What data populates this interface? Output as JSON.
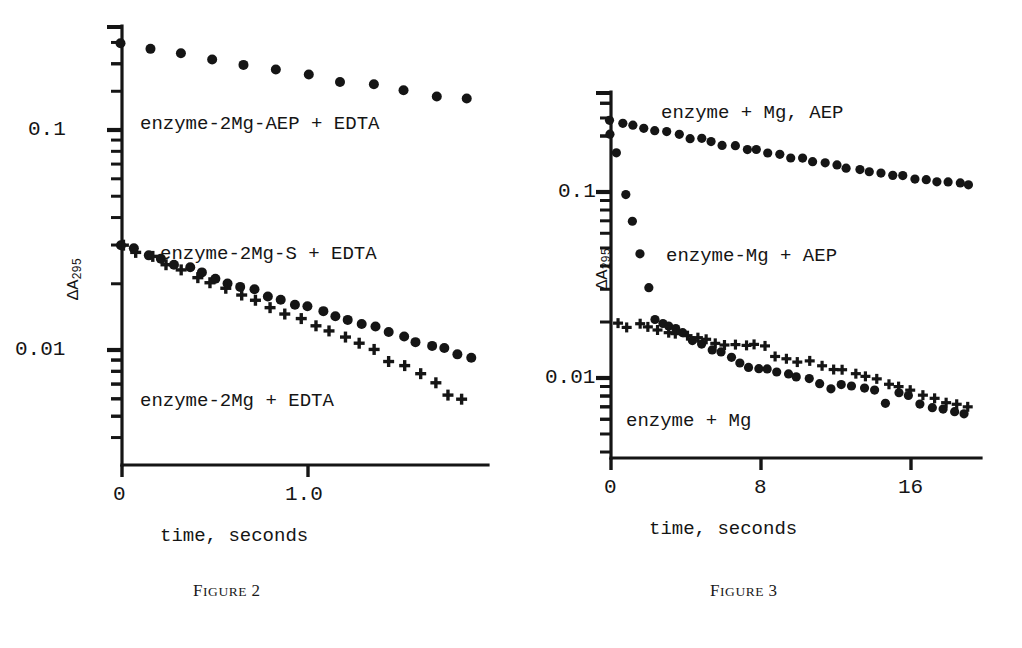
{
  "page": {
    "background": "#ffffff",
    "ink_color": "#151515",
    "width": 1022,
    "height": 648
  },
  "figures": [
    {
      "id": "figure-2",
      "caption_lead": "F",
      "caption_rest": "IGURE",
      "caption_number": "2",
      "caption_full": "FIGURE 2",
      "xlabel": "time, seconds",
      "ylabel_main": "ΔA",
      "ylabel_sub": "295",
      "x_tick_labels": [
        "0",
        "1.0"
      ],
      "x_tick_values": [
        0,
        1.0
      ],
      "y_tick_labels": [
        "0.1",
        "0.01"
      ],
      "y_tick_values": [
        0.1,
        0.01
      ],
      "series_labels": [
        "enzyme-2Mg-AEP + EDTA",
        "enzyme-2Mg-S + EDTA",
        "enzyme-2Mg + EDTA"
      ]
    },
    {
      "id": "figure-3",
      "caption_lead": "F",
      "caption_rest": "IGURE",
      "caption_number": "3",
      "caption_full": "FIGURE 3",
      "xlabel": "time, seconds",
      "ylabel_main": "ΔA",
      "ylabel_sub": "295",
      "x_tick_labels": [
        "0",
        "8",
        "16"
      ],
      "x_tick_values": [
        0,
        8,
        16
      ],
      "y_tick_labels": [
        "0.1",
        "0.01"
      ],
      "y_tick_values": [
        0.1,
        0.01
      ],
      "series_labels": [
        "enzyme + Mg, AEP",
        "enzyme-Mg + AEP",
        "enzyme + Mg"
      ]
    }
  ],
  "chart_data": [
    {
      "type": "scatter",
      "title": "FIGURE 2",
      "xlabel": "time, seconds",
      "ylabel": "ΔA295",
      "yscale": "log",
      "xlim": [
        0,
        1.98
      ],
      "ylim": [
        0.0042,
        0.26
      ],
      "grid": false,
      "legend": "inline-annotations",
      "x_ticks": [
        0,
        1.0
      ],
      "x_tick_labels": [
        "0",
        "1.0"
      ],
      "y_ticks": [
        0.01,
        0.1
      ],
      "y_tick_labels": [
        "0.01",
        "0.1"
      ],
      "y_minor_ticks": [
        0.005,
        0.006,
        0.007,
        0.008,
        0.009,
        0.02,
        0.03,
        0.04,
        0.05,
        0.06,
        0.07,
        0.08,
        0.09,
        0.2
      ],
      "series": [
        {
          "name": "enzyme-2Mg-AEP + EDTA",
          "marker": "circle",
          "x": [
            0.0,
            0.15,
            0.32,
            0.49,
            0.66,
            0.83,
            1.0,
            1.17,
            1.35,
            1.52,
            1.7,
            1.85
          ],
          "y": [
            0.244,
            0.232,
            0.221,
            0.209,
            0.198,
            0.186,
            0.177,
            0.168,
            0.159,
            0.151,
            0.144,
            0.138
          ]
        },
        {
          "name": "enzyme-2Mg-S + EDTA",
          "marker": "circle",
          "x": [
            0.0,
            0.07,
            0.14,
            0.21,
            0.28,
            0.36,
            0.43,
            0.5,
            0.57,
            0.64,
            0.72,
            0.79,
            0.86,
            0.93,
            1.0,
            1.08,
            1.15,
            1.22,
            1.29,
            1.37,
            1.44,
            1.51,
            1.58,
            1.66,
            1.73,
            1.8,
            1.88
          ],
          "y": [
            0.03,
            0.0286,
            0.0272,
            0.0258,
            0.0246,
            0.0234,
            0.0224,
            0.0214,
            0.0204,
            0.0195,
            0.0186,
            0.0178,
            0.017,
            0.0163,
            0.0156,
            0.0149,
            0.0143,
            0.0137,
            0.0131,
            0.0126,
            0.012,
            0.0115,
            0.011,
            0.0105,
            0.0101,
            0.0097,
            0.0093
          ]
        },
        {
          "name": "enzyme-2Mg + EDTA",
          "marker": "plus",
          "x": [
            0.0,
            0.08,
            0.16,
            0.24,
            0.32,
            0.4,
            0.48,
            0.56,
            0.64,
            0.72,
            0.8,
            0.88,
            0.96,
            1.04,
            1.12,
            1.2,
            1.28,
            1.36,
            1.44,
            1.52,
            1.6,
            1.68,
            1.76,
            1.82
          ],
          "y": [
            0.0298,
            0.0279,
            0.0262,
            0.0246,
            0.023,
            0.0216,
            0.0203,
            0.019,
            0.0178,
            0.0167,
            0.0157,
            0.0147,
            0.0138,
            0.0129,
            0.0121,
            0.0114,
            0.0107,
            0.01,
            0.009,
            0.0084,
            0.0079,
            0.0072,
            0.0062,
            0.006
          ]
        }
      ]
    },
    {
      "type": "scatter",
      "title": "FIGURE 3",
      "xlabel": "time, seconds",
      "ylabel": "ΔA295",
      "yscale": "log",
      "xlim": [
        0,
        19.5
      ],
      "ylim": [
        0.005,
        0.3
      ],
      "grid": false,
      "legend": "inline-annotations",
      "x_ticks": [
        0,
        8,
        16
      ],
      "x_tick_labels": [
        "0",
        "8",
        "16"
      ],
      "y_ticks": [
        0.01,
        0.1
      ],
      "y_tick_labels": [
        "0.01",
        "0.1"
      ],
      "y_minor_ticks": [
        0.006,
        0.007,
        0.008,
        0.009,
        0.02,
        0.03,
        0.04,
        0.05,
        0.06,
        0.07,
        0.08,
        0.09,
        0.2,
        0.3
      ],
      "series": [
        {
          "name": "enzyme + Mg, AEP",
          "marker": "circle",
          "x": [
            0.0,
            0.6,
            1.2,
            1.8,
            2.4,
            3.0,
            3.6,
            4.2,
            4.8,
            5.4,
            6.0,
            6.6,
            7.2,
            7.8,
            8.4,
            9.0,
            9.6,
            10.2,
            10.8,
            11.4,
            12.0,
            12.6,
            13.2,
            13.8,
            14.4,
            15.0,
            15.6,
            16.2,
            16.8,
            17.4,
            18.0,
            18.6,
            19.0
          ],
          "y": [
            0.238,
            0.232,
            0.226,
            0.22,
            0.214,
            0.208,
            0.202,
            0.197,
            0.191,
            0.186,
            0.181,
            0.176,
            0.171,
            0.167,
            0.162,
            0.158,
            0.154,
            0.15,
            0.146,
            0.143,
            0.139,
            0.136,
            0.133,
            0.13,
            0.127,
            0.124,
            0.122,
            0.119,
            0.117,
            0.115,
            0.113,
            0.111,
            0.11
          ]
        },
        {
          "name": "enzyme-Mg + AEP",
          "marker": "circle",
          "x": [
            0.0,
            0.35,
            0.75,
            1.15,
            1.55,
            1.95,
            2.35,
            2.75,
            3.1,
            3.5,
            3.9,
            4.4,
            4.9,
            5.4,
            5.9,
            6.4,
            6.9,
            7.4,
            7.9,
            8.4,
            8.9,
            9.4,
            9.9,
            10.5,
            11.1,
            11.7,
            12.3,
            12.9,
            13.5,
            14.1,
            14.7,
            15.3,
            15.9,
            16.5,
            17.1,
            17.7,
            18.3,
            18.9
          ],
          "y": [
            0.205,
            0.16,
            0.098,
            0.069,
            0.047,
            0.03,
            0.0205,
            0.02,
            0.0194,
            0.0186,
            0.0172,
            0.0162,
            0.0153,
            0.0144,
            0.0136,
            0.0128,
            0.0121,
            0.0114,
            0.0112,
            0.011,
            0.0107,
            0.0105,
            0.0103,
            0.01,
            0.0092,
            0.0089,
            0.0093,
            0.0091,
            0.0089,
            0.0087,
            0.0073,
            0.0083,
            0.0082,
            0.0071,
            0.0069,
            0.0067,
            0.0065,
            0.0064
          ]
        },
        {
          "name": "enzyme + Mg",
          "marker": "plus",
          "x": [
            0.3,
            0.9,
            1.5,
            2.0,
            2.5,
            3.0,
            3.5,
            4.1,
            4.6,
            5.1,
            5.6,
            6.1,
            6.6,
            7.2,
            7.7,
            8.2,
            8.8,
            9.4,
            10.0,
            10.6,
            11.2,
            11.8,
            12.4,
            13.0,
            13.6,
            14.2,
            14.8,
            15.4,
            16.0,
            16.6,
            17.2,
            17.8,
            18.4,
            19.0
          ],
          "y": [
            0.0196,
            0.0188,
            0.0192,
            0.019,
            0.018,
            0.0178,
            0.0174,
            0.0168,
            0.0165,
            0.016,
            0.0155,
            0.0152,
            0.015,
            0.015,
            0.015,
            0.0148,
            0.013,
            0.0126,
            0.0124,
            0.0122,
            0.0118,
            0.0113,
            0.011,
            0.0106,
            0.0103,
            0.01,
            0.0094,
            0.009,
            0.0086,
            0.0082,
            0.0078,
            0.0074,
            0.0072,
            0.007
          ]
        }
      ]
    }
  ]
}
